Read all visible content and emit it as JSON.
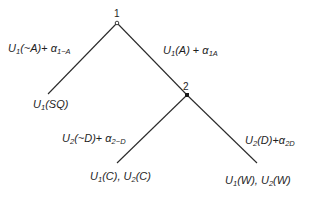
{
  "nodes": [
    {
      "id": "1",
      "label": "1",
      "x": 117,
      "y": 23,
      "style": "open"
    },
    {
      "id": "2",
      "label": "2",
      "x": 187,
      "y": 95,
      "style": "filled"
    }
  ],
  "edges": [
    {
      "from": "1",
      "to": "SQ",
      "x1": 117,
      "y1": 23,
      "x2": 48,
      "y2": 94
    },
    {
      "from": "1",
      "to": "2",
      "x1": 117,
      "y1": 23,
      "x2": 187,
      "y2": 95
    },
    {
      "from": "2",
      "to": "C",
      "x1": 187,
      "y1": 95,
      "x2": 117,
      "y2": 163
    },
    {
      "from": "2",
      "to": "W",
      "x1": 187,
      "y1": 95,
      "x2": 257,
      "y2": 163
    }
  ],
  "edge_labels": {
    "not_a": {
      "main": "U",
      "sub1": "1",
      "arg": "(~A)",
      "plus": "+ ",
      "alpha": "α",
      "sub2": "1~A"
    },
    "a": {
      "main": "U",
      "sub1": "1",
      "arg": "(A)",
      "plus": " + ",
      "alpha": "α",
      "sub2": "1A"
    },
    "not_d": {
      "main": "U",
      "sub1": "2",
      "arg": "(~D)",
      "plus": "+ ",
      "alpha": "α",
      "sub2": "2~D"
    },
    "d": {
      "main": "U",
      "sub1": "2",
      "arg": "(D)",
      "plus": "+",
      "alpha": "α",
      "sub2": "2D"
    }
  },
  "terminals": {
    "sq": {
      "u": "U",
      "s1": "1",
      "arg1": "(SQ)"
    },
    "c": {
      "u1": "U",
      "s1": "1",
      "arg1": "(C), ",
      "u2": "U",
      "s2": "2",
      "arg2": "(C)"
    },
    "w": {
      "u1": "U",
      "s1": "1",
      "arg1": "(W), ",
      "u2": "U",
      "s2": "2",
      "arg2": "(W)"
    }
  }
}
